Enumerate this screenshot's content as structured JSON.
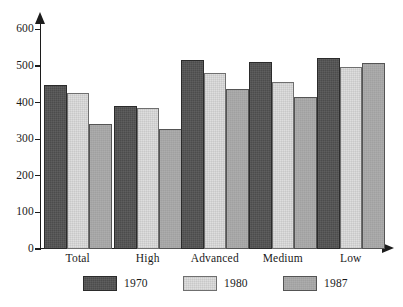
{
  "chart_data": {
    "type": "bar",
    "title": "",
    "subtitle": "",
    "xlabel": "",
    "ylabel": "",
    "categories": [
      "Total",
      "High",
      "Advanced",
      "Medium",
      "Low"
    ],
    "series": [
      {
        "name": "1970",
        "color": "#4c4c4c",
        "values": [
          447,
          390,
          515,
          512,
          522
        ]
      },
      {
        "name": "1980",
        "color": "#dedede",
        "values": [
          427,
          385,
          482,
          455,
          497
        ]
      },
      {
        "name": "1987",
        "color": "#a0a0a0",
        "values": [
          342,
          328,
          438,
          415,
          509
        ]
      }
    ],
    "ylim": [
      0,
      620
    ],
    "yticks": [
      0,
      100,
      200,
      300,
      400,
      500,
      600
    ],
    "ytick_labels": [
      "0",
      "100",
      "200",
      "300",
      "400",
      "500",
      "600"
    ],
    "grid": false,
    "legend_position": "bottom",
    "annotations": []
  }
}
